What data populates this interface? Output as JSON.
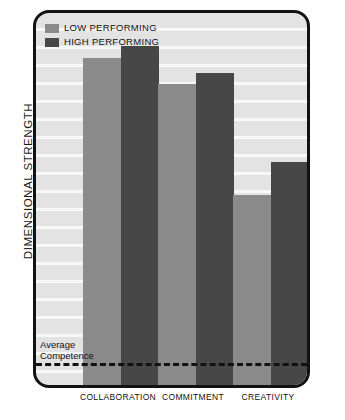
{
  "chart_data": {
    "type": "bar",
    "title": "",
    "subtitle": "",
    "xlabel": "",
    "ylabel": "DIMENSIONAL STRENGTH",
    "categories": [
      "COLLABORATION",
      "COMMITMENT",
      "CREATIVITY"
    ],
    "series": [
      {
        "name": "LOW PERFORMING",
        "color": "#8a8a8a",
        "values": [
          88,
          81,
          51
        ]
      },
      {
        "name": "HIGH PERFORMING",
        "color": "#474747",
        "values": [
          91,
          84,
          60
        ]
      }
    ],
    "ylim": [
      0,
      100
    ],
    "grid": true,
    "grid_orientation": "horizontal",
    "legend_position": "top-left",
    "annotations": [
      {
        "name": "average-competence",
        "label": "Average\nCompetence",
        "label_line1": "Average",
        "label_line2": "Competence",
        "type": "horizontal-dashed-line",
        "y": 6
      }
    ]
  },
  "legend": {
    "items": [
      {
        "label": "LOW PERFORMING",
        "color": "#8a8a8a"
      },
      {
        "label": "HIGH PERFORMING",
        "color": "#474747"
      }
    ]
  },
  "axis": {
    "y_title": "DIMENSIONAL STRENGTH"
  },
  "annotation": {
    "avg_line1": "Average",
    "avg_line2": "Competence"
  },
  "colors": {
    "low_performing": "#8a8a8a",
    "high_performing": "#474747",
    "plot_background": "#e3e3e3",
    "frame_border": "#121212",
    "gridline": "#ffffff",
    "page_background": "#ffffff",
    "text": "#111111"
  },
  "layout": {
    "bar_width_px": 38,
    "group_centers_px": [
      85,
      160,
      235
    ],
    "plot_height_px": 372,
    "baseline_y_px": 372
  }
}
